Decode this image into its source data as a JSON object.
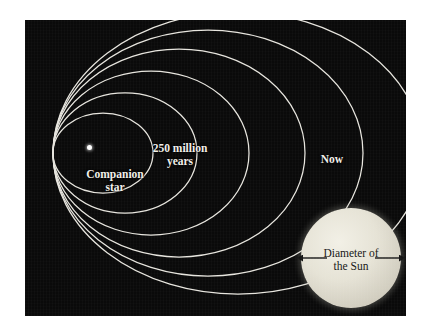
{
  "figure": {
    "background_color": "#ffffff",
    "panel_color": "#0a0a0a",
    "orbit_color": "#e8e6df",
    "label_color": "#f2f0ea",
    "sun_color": "#e6e3d6",
    "sun_label_color": "#151515"
  },
  "labels": {
    "companion_star": {
      "line1": "Companion",
      "line2": "star"
    },
    "time_inner": {
      "line1": "250 million",
      "line2": "years"
    },
    "time_outer": {
      "line1": "Now"
    },
    "sun": {
      "line1": "Diameter of",
      "line2": "the Sun"
    }
  },
  "chart_data": {
    "type": "diagram",
    "grid": false,
    "legend": "none",
    "center_marker": {
      "name": "Companion star",
      "x": 64,
      "y": 127,
      "radius": 2.5,
      "color": "#ffffff"
    },
    "orbits": [
      {
        "index": 1,
        "label": "",
        "rx": 50,
        "ry": 40,
        "cx": 78,
        "cy": 133
      },
      {
        "index": 2,
        "label": "250 million years",
        "rx": 72,
        "ry": 60,
        "cx": 100,
        "cy": 133
      },
      {
        "index": 3,
        "label": "",
        "rx": 98,
        "ry": 82,
        "cx": 126,
        "cy": 133
      },
      {
        "index": 4,
        "label": "",
        "rx": 126,
        "ry": 104,
        "cx": 154,
        "cy": 133
      },
      {
        "index": 5,
        "label": "",
        "rx": 155,
        "ry": 123,
        "cx": 183,
        "cy": 133
      },
      {
        "index": 6,
        "label": "Now",
        "rx": 185,
        "ry": 141,
        "cx": 213,
        "cy": 133
      }
    ],
    "orbit_count": 6,
    "time_annotations": [
      {
        "text": "250 million years",
        "orbit_index": 2
      },
      {
        "text": "Now",
        "orbit_index": 6
      }
    ],
    "scale_reference": {
      "text": "Diameter of the Sun",
      "shape": "circle",
      "cx": 326,
      "cy": 238,
      "diameter": 100,
      "arrow": "double-headed"
    }
  }
}
